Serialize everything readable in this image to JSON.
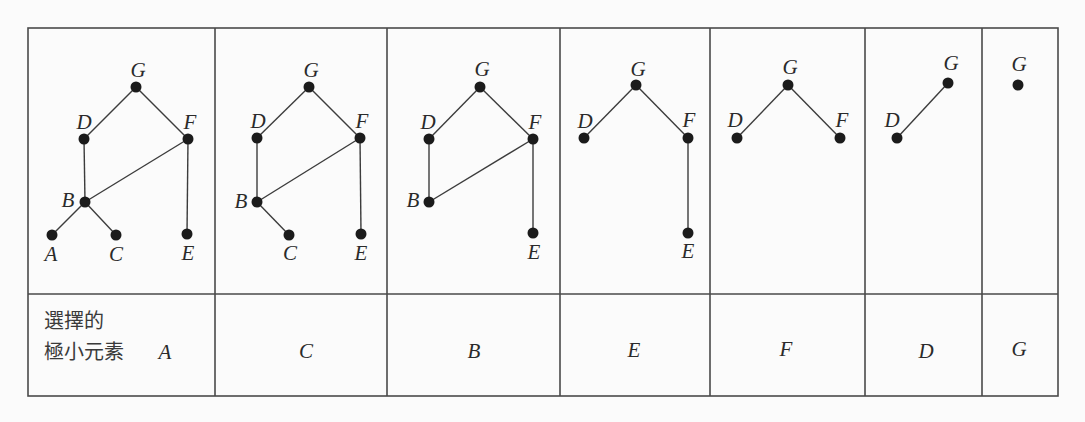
{
  "figure_type": "hasse-diagram-topological-sort-table",
  "colors": {
    "page_bg": "#fbfbfb",
    "grid": "#4a4a4a",
    "edge": "#3c3c3c",
    "node_fill": "#1b1b1b",
    "label_ink": "#2a2a2a"
  },
  "caption": {
    "lines": [
      "選擇的",
      "極小元素"
    ]
  },
  "layout": {
    "table": {
      "left": 28,
      "top": 28,
      "right": 1058,
      "bottom": 396,
      "row_divider_y": 294
    },
    "column_borders": [
      28,
      215,
      387,
      560,
      710,
      865,
      982,
      1058
    ],
    "node_radius": 5.5,
    "label_font_size": 21,
    "grid_stroke_width": 1.6,
    "edge_stroke_width": 1.4
  },
  "selection_order": [
    "A",
    "C",
    "B",
    "E",
    "F",
    "D",
    "G"
  ],
  "panels": [
    {
      "selected": "A",
      "selected_label_pos": {
        "x": 165,
        "y": 352
      },
      "nodes": [
        {
          "id": "G",
          "x": 136,
          "y": 87,
          "lx": 138,
          "ly": 70
        },
        {
          "id": "D",
          "x": 84,
          "y": 139,
          "lx": 84,
          "ly": 122
        },
        {
          "id": "F",
          "x": 188,
          "y": 139,
          "lx": 190,
          "ly": 122
        },
        {
          "id": "B",
          "x": 85,
          "y": 202,
          "lx": 68,
          "ly": 200
        },
        {
          "id": "A",
          "x": 52,
          "y": 235,
          "lx": 51,
          "ly": 254
        },
        {
          "id": "C",
          "x": 116,
          "y": 235,
          "lx": 116,
          "ly": 254
        },
        {
          "id": "E",
          "x": 187,
          "y": 234,
          "lx": 188,
          "ly": 253
        }
      ],
      "edges": [
        [
          "G",
          "D"
        ],
        [
          "G",
          "F"
        ],
        [
          "D",
          "B"
        ],
        [
          "B",
          "F"
        ],
        [
          "B",
          "A"
        ],
        [
          "B",
          "C"
        ],
        [
          "F",
          "E"
        ]
      ]
    },
    {
      "selected": "C",
      "selected_label_pos": {
        "x": 306,
        "y": 351
      },
      "nodes": [
        {
          "id": "G",
          "x": 309,
          "y": 87,
          "lx": 311,
          "ly": 70
        },
        {
          "id": "D",
          "x": 257,
          "y": 138,
          "lx": 258,
          "ly": 121
        },
        {
          "id": "F",
          "x": 360,
          "y": 138,
          "lx": 362,
          "ly": 121
        },
        {
          "id": "B",
          "x": 257,
          "y": 202,
          "lx": 241,
          "ly": 201
        },
        {
          "id": "C",
          "x": 289,
          "y": 235,
          "lx": 290,
          "ly": 253
        },
        {
          "id": "E",
          "x": 361,
          "y": 234,
          "lx": 361,
          "ly": 253
        }
      ],
      "edges": [
        [
          "G",
          "D"
        ],
        [
          "G",
          "F"
        ],
        [
          "D",
          "B"
        ],
        [
          "B",
          "F"
        ],
        [
          "B",
          "C"
        ],
        [
          "F",
          "E"
        ]
      ]
    },
    {
      "selected": "B",
      "selected_label_pos": {
        "x": 474,
        "y": 351
      },
      "nodes": [
        {
          "id": "G",
          "x": 480,
          "y": 87,
          "lx": 482,
          "ly": 69
        },
        {
          "id": "D",
          "x": 429,
          "y": 139,
          "lx": 428,
          "ly": 122
        },
        {
          "id": "F",
          "x": 533,
          "y": 139,
          "lx": 535,
          "ly": 122
        },
        {
          "id": "B",
          "x": 429,
          "y": 202,
          "lx": 413,
          "ly": 200
        },
        {
          "id": "E",
          "x": 533,
          "y": 233,
          "lx": 534,
          "ly": 252
        }
      ],
      "edges": [
        [
          "G",
          "D"
        ],
        [
          "G",
          "F"
        ],
        [
          "D",
          "B"
        ],
        [
          "B",
          "F"
        ],
        [
          "F",
          "E"
        ]
      ]
    },
    {
      "selected": "E",
      "selected_label_pos": {
        "x": 634,
        "y": 350
      },
      "nodes": [
        {
          "id": "G",
          "x": 636,
          "y": 85,
          "lx": 638,
          "ly": 69
        },
        {
          "id": "D",
          "x": 584,
          "y": 138,
          "lx": 585,
          "ly": 121
        },
        {
          "id": "F",
          "x": 688,
          "y": 138,
          "lx": 689,
          "ly": 120
        },
        {
          "id": "E",
          "x": 688,
          "y": 233,
          "lx": 688,
          "ly": 251
        }
      ],
      "edges": [
        [
          "G",
          "D"
        ],
        [
          "G",
          "F"
        ],
        [
          "F",
          "E"
        ]
      ]
    },
    {
      "selected": "F",
      "selected_label_pos": {
        "x": 786,
        "y": 349
      },
      "nodes": [
        {
          "id": "G",
          "x": 788,
          "y": 85,
          "lx": 790,
          "ly": 67
        },
        {
          "id": "D",
          "x": 737,
          "y": 138,
          "lx": 735,
          "ly": 120
        },
        {
          "id": "F",
          "x": 840,
          "y": 138,
          "lx": 842,
          "ly": 120
        }
      ],
      "edges": [
        [
          "G",
          "D"
        ],
        [
          "G",
          "F"
        ]
      ]
    },
    {
      "selected": "D",
      "selected_label_pos": {
        "x": 926,
        "y": 351
      },
      "nodes": [
        {
          "id": "D",
          "x": 897,
          "y": 138,
          "lx": 892,
          "ly": 120
        },
        {
          "id": "G",
          "x": 948,
          "y": 83,
          "lx": 951,
          "ly": 63
        }
      ],
      "edges": [
        [
          "D",
          "G"
        ]
      ]
    },
    {
      "selected": "G",
      "selected_label_pos": {
        "x": 1019,
        "y": 349
      },
      "nodes": [
        {
          "id": "G",
          "x": 1018,
          "y": 85,
          "lx": 1019,
          "ly": 64
        }
      ],
      "edges": []
    }
  ]
}
